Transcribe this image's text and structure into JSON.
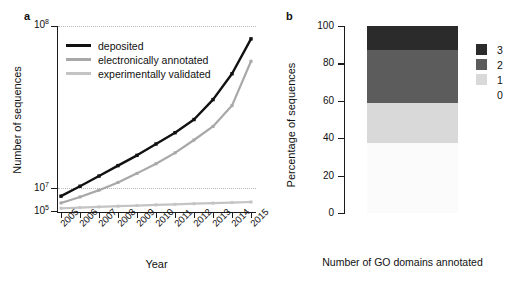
{
  "figure": {
    "panel_a_letter": "a",
    "panel_b_letter": "b"
  },
  "panel_a": {
    "ylabel": "Number of sequences",
    "xlabel": "Year",
    "ytick_labels": [
      "10",
      "10",
      "10"
    ],
    "ytick_exponents": [
      "8",
      "7",
      "5"
    ],
    "legend": [
      {
        "label": "deposited",
        "color": "#111111"
      },
      {
        "label": "electronically annotated",
        "color": "#a8a8a8"
      },
      {
        "label": "experimentally validated",
        "color": "#c4c4c4"
      }
    ]
  },
  "panel_b": {
    "ylabel": "Percentage of sequences",
    "xlabel": "Number of GO domains annotated",
    "ytick_labels": [
      "100",
      "80",
      "60",
      "40",
      "20",
      "0"
    ],
    "legend": [
      {
        "label": "3",
        "color": "#2b2b2b"
      },
      {
        "label": "2",
        "color": "#5c5c5c"
      },
      {
        "label": "1",
        "color": "#d9d9d9"
      },
      {
        "label": "0",
        "color": "#fbfbfb"
      }
    ]
  },
  "chart_data": [
    {
      "type": "line",
      "panel": "a",
      "title": "",
      "xlabel": "Year",
      "ylabel": "Number of sequences",
      "yscale": "log",
      "ylim": [
        100000,
        100000000
      ],
      "ytick_values": [
        100000000,
        10000000,
        100000
      ],
      "ytick_text": [
        "10^8",
        "10^7",
        "10^5"
      ],
      "grid": "horizontal-dotted",
      "legend_position": "top-left",
      "categories": [
        2005,
        2006,
        2007,
        2008,
        2009,
        2010,
        2011,
        2012,
        2013,
        2014,
        2015
      ],
      "series": [
        {
          "name": "deposited",
          "color": "#111111",
          "values": [
            180000,
            260000,
            380000,
            560000,
            820000,
            1250000,
            1900000,
            3100000,
            6500000,
            17000000,
            62000000
          ]
        },
        {
          "name": "electronically annotated",
          "color": "#a8a8a8",
          "values": [
            140000,
            175000,
            225000,
            300000,
            420000,
            600000,
            900000,
            1450000,
            2400000,
            5200000,
            27000000
          ]
        },
        {
          "name": "experimentally validated",
          "color": "#c4c4c4",
          "values": [
            115000,
            118000,
            121000,
            124000,
            127000,
            130000,
            133000,
            136000,
            139000,
            142000,
            145000
          ]
        }
      ]
    },
    {
      "type": "bar",
      "panel": "b",
      "stacked": true,
      "title": "",
      "xlabel": "Number of GO domains annotated",
      "ylabel": "Percentage of sequences",
      "ylim": [
        0,
        100
      ],
      "ytick_values": [
        0,
        20,
        40,
        60,
        80,
        100
      ],
      "categories": [
        "all sequences"
      ],
      "legend_position": "right",
      "series": [
        {
          "name": "3",
          "color": "#2b2b2b",
          "values": [
            13.0
          ]
        },
        {
          "name": "2",
          "color": "#5c5c5c",
          "values": [
            28.0
          ]
        },
        {
          "name": "1",
          "color": "#d9d9d9",
          "values": [
            21.5
          ]
        },
        {
          "name": "0",
          "color": "#fbfbfb",
          "values": [
            37.5
          ]
        }
      ]
    }
  ]
}
